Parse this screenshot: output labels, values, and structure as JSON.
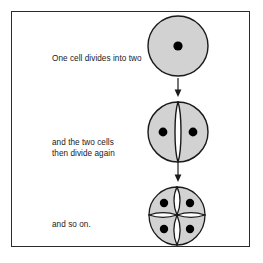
{
  "figure": {
    "name": "cell-division-diagram",
    "border_color": "#2b2b2b",
    "background_color": "#ffffff"
  },
  "style": {
    "cell_fill": "#d2d2d2",
    "cell_outline": "#1a1a1a",
    "nucleus_color": "#000000",
    "arrow_color": "#1a1a1a",
    "text_color": "#1a1a1a"
  },
  "stages": [
    {
      "id": "stage-1",
      "caption": "One cell divides into two",
      "cell_count": 1,
      "nucleus_count": 1,
      "icon": "single-cell-icon"
    },
    {
      "id": "stage-2",
      "caption": "and the two cells\nthen divide again",
      "cell_count": 2,
      "nucleus_count": 2,
      "icon": "two-cell-icon"
    },
    {
      "id": "stage-3",
      "caption": "and so on.",
      "cell_count": 4,
      "nucleus_count": 4,
      "icon": "four-cell-icon"
    }
  ],
  "connectors": [
    {
      "id": "arrow-1",
      "icon": "arrow-down-icon",
      "from": "stage-1",
      "to": "stage-2"
    },
    {
      "id": "arrow-2",
      "icon": "arrow-down-icon",
      "from": "stage-2",
      "to": "stage-3"
    }
  ]
}
